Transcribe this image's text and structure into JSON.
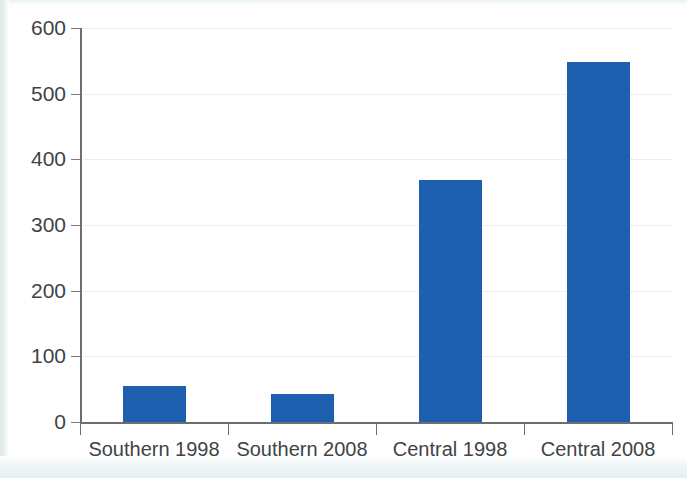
{
  "chart_data": {
    "type": "bar",
    "title": "",
    "subtitle": "",
    "xlabel": "",
    "ylabel": "",
    "categories": [
      "Southern 1998",
      "Southern 2008",
      "Central 1998",
      "Central 2008"
    ],
    "values": [
      55,
      42,
      368,
      548
    ],
    "series": [
      {
        "name": "",
        "values": [
          55,
          42,
          368,
          548
        ]
      }
    ],
    "ylim": [
      0,
      600
    ],
    "yticks": [
      0,
      100,
      200,
      300,
      400,
      500,
      600
    ],
    "ytick_labels": [
      "0",
      "100",
      "200",
      "300",
      "400",
      "500",
      "600"
    ],
    "grid": true,
    "grid_axis": "y",
    "legend": false,
    "legend_position": "none",
    "bar_color": "#1f5faf",
    "axis_color": "#6b6f72",
    "grid_color": "#d9dddd",
    "text_color": "#3f4346",
    "background_color": "#ffffff"
  }
}
